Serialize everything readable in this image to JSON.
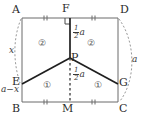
{
  "figure": {
    "type": "geometry-diagram",
    "vertices": [
      {
        "id": "A",
        "label": "A",
        "x": 22,
        "y": 18
      },
      {
        "id": "F",
        "label": "F",
        "x": 70,
        "y": 18
      },
      {
        "id": "D",
        "label": "D",
        "x": 118,
        "y": 18
      },
      {
        "id": "E",
        "label": "E",
        "x": 22,
        "y": 84
      },
      {
        "id": "P",
        "label": "P",
        "x": 70,
        "y": 58
      },
      {
        "id": "G",
        "label": "G",
        "x": 118,
        "y": 84
      },
      {
        "id": "B",
        "label": "B",
        "x": 22,
        "y": 102
      },
      {
        "id": "M",
        "label": "M",
        "x": 70,
        "y": 102
      },
      {
        "id": "C",
        "label": "C",
        "x": 118,
        "y": 102
      }
    ],
    "solid_edges": [
      {
        "from": "A",
        "to": "D",
        "name": "top-edge-AD"
      },
      {
        "from": "A",
        "to": "B",
        "name": "left-edge-AB"
      },
      {
        "from": "D",
        "to": "C",
        "name": "right-edge-DC"
      },
      {
        "from": "B",
        "to": "C",
        "name": "bottom-edge-BC"
      },
      {
        "from": "F",
        "to": "P",
        "name": "segment-FP"
      },
      {
        "from": "E",
        "to": "P",
        "name": "segment-EP"
      },
      {
        "from": "P",
        "to": "G",
        "name": "segment-PG"
      }
    ],
    "dashed_edges": [
      {
        "from": "P",
        "to": "M",
        "name": "segment-PM"
      }
    ],
    "arcs": [
      {
        "name": "arc-left-AE",
        "label": "x",
        "side": "left"
      },
      {
        "name": "arc-right-DC",
        "label": "a",
        "side": "right"
      }
    ],
    "right_angle_at": "F",
    "tick_marks": [
      {
        "name": "tick-AF",
        "on": "A-F"
      },
      {
        "name": "tick-FD",
        "on": "F-D"
      },
      {
        "name": "tick-BM",
        "on": "B-M"
      },
      {
        "name": "tick-MC",
        "on": "M-C"
      }
    ],
    "measure_labels": [
      {
        "name": "label-half-a-upper",
        "num": "1",
        "den": "2",
        "suffix": "a",
        "x": 74,
        "y": 32
      },
      {
        "name": "label-half-a-lower",
        "num": "1",
        "den": "2",
        "suffix": "a",
        "x": 74,
        "y": 74
      },
      {
        "name": "label-x",
        "text": "x",
        "x": 11,
        "y": 50
      },
      {
        "name": "label-a-minus-x",
        "text": "a−x",
        "x": 2,
        "y": 88
      },
      {
        "name": "label-a-right",
        "text": "a",
        "x": 133,
        "y": 60
      }
    ],
    "region_labels": [
      {
        "name": "region-2-left",
        "text": "②",
        "x": 40,
        "y": 43
      },
      {
        "name": "region-2-right",
        "text": "②",
        "x": 89,
        "y": 43
      },
      {
        "name": "region-1-left",
        "text": "①",
        "x": 45,
        "y": 85
      },
      {
        "name": "region-1-right",
        "text": "①",
        "x": 96,
        "y": 85
      }
    ],
    "colors": {
      "stroke": "#5a5a5a",
      "bold_stroke": "#1f1f1f",
      "dashed": "#7a7a7a",
      "text": "#2b2b2b",
      "background": "#ffffff"
    }
  }
}
